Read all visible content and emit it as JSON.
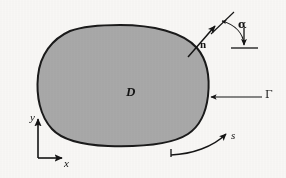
{
  "figure": {
    "caption_absent": true,
    "background_color": "#f9f8f6",
    "region": {
      "name": "D",
      "label": "D",
      "fill_color": "#a9a9a9",
      "outline_color": "#1a1a1a",
      "outline_width_px": 2
    },
    "boundary": {
      "name": "Gamma",
      "label": "Γ",
      "pointer_arrow": "horizontal-left-arrow"
    },
    "normal_vector": {
      "label": "n",
      "style": "bold-upright",
      "description": "outward unit normal arrow"
    },
    "angle": {
      "label": "α",
      "description": "angle between normal direction and vertical reference",
      "reference_line": "horizontal-baseline",
      "sweep_arrow": "curved-arc-arrow"
    },
    "arclength": {
      "label": "s",
      "description": "arc length parameter along boundary",
      "direction_arrow": "counterclockwise-curved-arrow",
      "tick_mark": true
    },
    "axes": {
      "x_label": "x",
      "y_label": "y",
      "origin_px": [
        38,
        158
      ],
      "x_axis_end_px": [
        62,
        158
      ],
      "y_axis_end_px": [
        38,
        116
      ],
      "color": "#141414"
    }
  }
}
